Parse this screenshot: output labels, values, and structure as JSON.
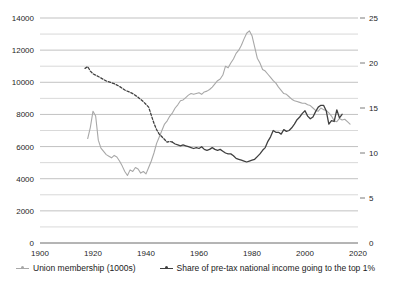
{
  "chart_data": {
    "type": "line",
    "title": "",
    "subtitle": "",
    "xlabel": "",
    "ylabel": "",
    "grid": true,
    "legend_position": "bottom",
    "x": {
      "min": 1900,
      "max": 2020,
      "ticks": [
        1900,
        1920,
        1940,
        1960,
        1980,
        2000,
        2020
      ]
    },
    "y_left": {
      "min": 0,
      "max": 14000,
      "ticks": [
        0,
        2000,
        4000,
        6000,
        8000,
        10000,
        12000,
        14000
      ],
      "minor_step": 1000,
      "label": "Union membership (1000s)"
    },
    "y_right": {
      "min": 0,
      "max": 25,
      "ticks": [
        0,
        5,
        10,
        15,
        20,
        25
      ],
      "label": "Share of pre-tax national income going to the top 1%"
    },
    "series": [
      {
        "name": "Union membership (1000s)",
        "axis": "left",
        "color": "#a8a8a8",
        "style": "solid",
        "points": [
          [
            1918,
            6500
          ],
          [
            1919,
            7200
          ],
          [
            1920,
            8200
          ],
          [
            1921,
            7900
          ],
          [
            1922,
            6400
          ],
          [
            1923,
            5900
          ],
          [
            1924,
            5700
          ],
          [
            1925,
            5500
          ],
          [
            1926,
            5400
          ],
          [
            1927,
            5300
          ],
          [
            1928,
            5450
          ],
          [
            1929,
            5350
          ],
          [
            1930,
            5100
          ],
          [
            1931,
            4800
          ],
          [
            1932,
            4450
          ],
          [
            1933,
            4200
          ],
          [
            1934,
            4550
          ],
          [
            1935,
            4450
          ],
          [
            1936,
            4700
          ],
          [
            1937,
            4600
          ],
          [
            1938,
            4350
          ],
          [
            1939,
            4450
          ],
          [
            1940,
            4300
          ],
          [
            1941,
            4700
          ],
          [
            1942,
            5100
          ],
          [
            1943,
            5600
          ],
          [
            1944,
            6200
          ],
          [
            1945,
            6600
          ],
          [
            1946,
            7000
          ],
          [
            1947,
            7400
          ],
          [
            1948,
            7600
          ],
          [
            1949,
            7900
          ],
          [
            1950,
            8100
          ],
          [
            1951,
            8400
          ],
          [
            1952,
            8600
          ],
          [
            1953,
            8850
          ],
          [
            1954,
            8900
          ],
          [
            1955,
            9050
          ],
          [
            1956,
            9200
          ],
          [
            1957,
            9300
          ],
          [
            1958,
            9250
          ],
          [
            1959,
            9300
          ],
          [
            1960,
            9350
          ],
          [
            1961,
            9250
          ],
          [
            1962,
            9400
          ],
          [
            1963,
            9450
          ],
          [
            1964,
            9550
          ],
          [
            1965,
            9700
          ],
          [
            1966,
            9900
          ],
          [
            1967,
            10100
          ],
          [
            1968,
            10200
          ],
          [
            1969,
            10450
          ],
          [
            1970,
            11000
          ],
          [
            1971,
            10900
          ],
          [
            1972,
            11200
          ],
          [
            1973,
            11450
          ],
          [
            1974,
            11800
          ],
          [
            1975,
            12000
          ],
          [
            1976,
            12300
          ],
          [
            1977,
            12700
          ],
          [
            1978,
            13050
          ],
          [
            1979,
            13200
          ],
          [
            1980,
            12900
          ],
          [
            1981,
            12200
          ],
          [
            1982,
            11500
          ],
          [
            1983,
            11200
          ],
          [
            1984,
            10800
          ],
          [
            1985,
            10700
          ],
          [
            1986,
            10500
          ],
          [
            1987,
            10300
          ],
          [
            1988,
            10100
          ],
          [
            1989,
            9950
          ],
          [
            1990,
            9700
          ],
          [
            1991,
            9500
          ],
          [
            1992,
            9300
          ],
          [
            1993,
            9250
          ],
          [
            1994,
            9100
          ],
          [
            1995,
            8950
          ],
          [
            1996,
            8850
          ],
          [
            1997,
            8800
          ],
          [
            1998,
            8750
          ],
          [
            1999,
            8700
          ],
          [
            2000,
            8700
          ],
          [
            2001,
            8600
          ],
          [
            2002,
            8550
          ],
          [
            2003,
            8400
          ],
          [
            2004,
            8250
          ],
          [
            2005,
            8200
          ],
          [
            2006,
            8400
          ],
          [
            2007,
            8300
          ],
          [
            2008,
            8250
          ],
          [
            2009,
            8100
          ],
          [
            2010,
            7900
          ],
          [
            2011,
            7600
          ],
          [
            2012,
            7550
          ],
          [
            2013,
            7750
          ],
          [
            2014,
            7650
          ],
          [
            2015,
            7700
          ],
          [
            2016,
            7550
          ],
          [
            2017,
            7400
          ]
        ]
      },
      {
        "name": "Share of pre-tax national income going to the top 1%",
        "axis": "right",
        "color": "#404040",
        "style": "dashed_then_solid",
        "solid_from": 1950,
        "points": [
          [
            1917,
            19.4
          ],
          [
            1918,
            19.6
          ],
          [
            1919,
            19.1
          ],
          [
            1920,
            18.8
          ],
          [
            1922,
            18.5
          ],
          [
            1925,
            18.0
          ],
          [
            1928,
            17.7
          ],
          [
            1930,
            17.4
          ],
          [
            1932,
            17.0
          ],
          [
            1935,
            16.6
          ],
          [
            1937,
            16.2
          ],
          [
            1939,
            15.7
          ],
          [
            1941,
            15.1
          ],
          [
            1942,
            14.2
          ],
          [
            1943,
            13.3
          ],
          [
            1944,
            12.6
          ],
          [
            1945,
            12.1
          ],
          [
            1946,
            11.8
          ],
          [
            1947,
            11.5
          ],
          [
            1948,
            11.2
          ],
          [
            1949,
            11.3
          ],
          [
            1950,
            11.2
          ],
          [
            1951,
            11.0
          ],
          [
            1952,
            10.9
          ],
          [
            1953,
            10.8
          ],
          [
            1954,
            10.9
          ],
          [
            1955,
            10.8
          ],
          [
            1956,
            10.7
          ],
          [
            1957,
            10.6
          ],
          [
            1958,
            10.5
          ],
          [
            1959,
            10.6
          ],
          [
            1960,
            10.5
          ],
          [
            1961,
            10.7
          ],
          [
            1962,
            10.4
          ],
          [
            1963,
            10.3
          ],
          [
            1964,
            10.4
          ],
          [
            1965,
            10.6
          ],
          [
            1966,
            10.4
          ],
          [
            1967,
            10.3
          ],
          [
            1968,
            10.4
          ],
          [
            1969,
            10.2
          ],
          [
            1970,
            10.0
          ],
          [
            1971,
            9.9
          ],
          [
            1972,
            9.9
          ],
          [
            1973,
            9.7
          ],
          [
            1974,
            9.4
          ],
          [
            1975,
            9.3
          ],
          [
            1976,
            9.2
          ],
          [
            1977,
            9.1
          ],
          [
            1978,
            9.0
          ],
          [
            1979,
            9.1
          ],
          [
            1980,
            9.2
          ],
          [
            1981,
            9.3
          ],
          [
            1982,
            9.6
          ],
          [
            1983,
            9.9
          ],
          [
            1984,
            10.3
          ],
          [
            1985,
            10.6
          ],
          [
            1986,
            11.3
          ],
          [
            1987,
            11.8
          ],
          [
            1988,
            12.5
          ],
          [
            1989,
            12.3
          ],
          [
            1990,
            12.3
          ],
          [
            1991,
            12.1
          ],
          [
            1992,
            12.6
          ],
          [
            1993,
            12.4
          ],
          [
            1994,
            12.5
          ],
          [
            1995,
            12.8
          ],
          [
            1996,
            13.2
          ],
          [
            1997,
            13.7
          ],
          [
            1998,
            14.0
          ],
          [
            1999,
            14.4
          ],
          [
            2000,
            14.7
          ],
          [
            2001,
            14.1
          ],
          [
            2002,
            13.8
          ],
          [
            2003,
            14.0
          ],
          [
            2004,
            14.6
          ],
          [
            2005,
            15.1
          ],
          [
            2006,
            15.3
          ],
          [
            2007,
            15.3
          ],
          [
            2008,
            14.7
          ],
          [
            2009,
            13.2
          ],
          [
            2010,
            13.6
          ],
          [
            2011,
            13.5
          ],
          [
            2012,
            14.8
          ],
          [
            2013,
            13.9
          ],
          [
            2014,
            14.3
          ]
        ]
      }
    ]
  },
  "axes": {
    "left_ticks": [
      "0",
      "2000",
      "4000",
      "6000",
      "8000",
      "10000",
      "12000",
      "14000"
    ],
    "right_ticks": [
      "0",
      "5",
      "10",
      "15",
      "20",
      "25"
    ],
    "x_ticks": [
      "1900",
      "1920",
      "1940",
      "1960",
      "1980",
      "2000",
      "2020"
    ]
  },
  "legend": {
    "items": [
      {
        "label": "Union membership (1000s)",
        "color": "#a8a8a8"
      },
      {
        "label": "Share of pre-tax national income going to the top 1%",
        "color": "#404040"
      }
    ]
  }
}
